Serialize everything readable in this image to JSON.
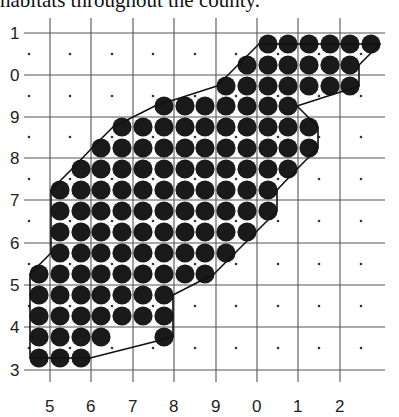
{
  "caption": "habitats throughout the county.",
  "figure": {
    "type": "grid dot map",
    "y_axis_labels": [
      "1",
      "0",
      "9",
      "8",
      "7",
      "6",
      "5",
      "4",
      "3"
    ],
    "x_axis_labels": [
      "5",
      "6",
      "7",
      "8",
      "9",
      "0",
      "1",
      "2"
    ],
    "colors": {
      "grid": "#555555",
      "filled_dot": "#1a1a1a",
      "small_dot": "#333333",
      "outline": "#111111"
    },
    "dot_columns_x": [
      39,
      60,
      81,
      101,
      122,
      143,
      164,
      185,
      205,
      226,
      247,
      268,
      288,
      309,
      330,
      350,
      371
    ],
    "filled_rows": [
      {
        "y": 44,
        "from": 11,
        "to": 16
      },
      {
        "y": 65,
        "from": 10,
        "to": 15
      },
      {
        "y": 86,
        "from": 9,
        "to": 15
      },
      {
        "y": 106,
        "from": 6,
        "to": 12
      },
      {
        "y": 127,
        "from": 4,
        "to": 13
      },
      {
        "y": 148,
        "from": 3,
        "to": 13
      },
      {
        "y": 169,
        "from": 2,
        "to": 12
      },
      {
        "y": 190,
        "from": 1,
        "to": 11
      },
      {
        "y": 211,
        "from": 1,
        "to": 11
      },
      {
        "y": 232,
        "from": 1,
        "to": 10
      },
      {
        "y": 253,
        "from": 1,
        "to": 9
      },
      {
        "y": 274,
        "from": 0,
        "to": 8
      },
      {
        "y": 295,
        "from": 0,
        "to": 6
      },
      {
        "y": 316,
        "from": 0,
        "to": 6
      },
      {
        "y": 337,
        "cols": [
          0,
          1,
          2,
          3,
          6
        ]
      },
      {
        "y": 358,
        "from": 0,
        "to": 2
      }
    ]
  }
}
